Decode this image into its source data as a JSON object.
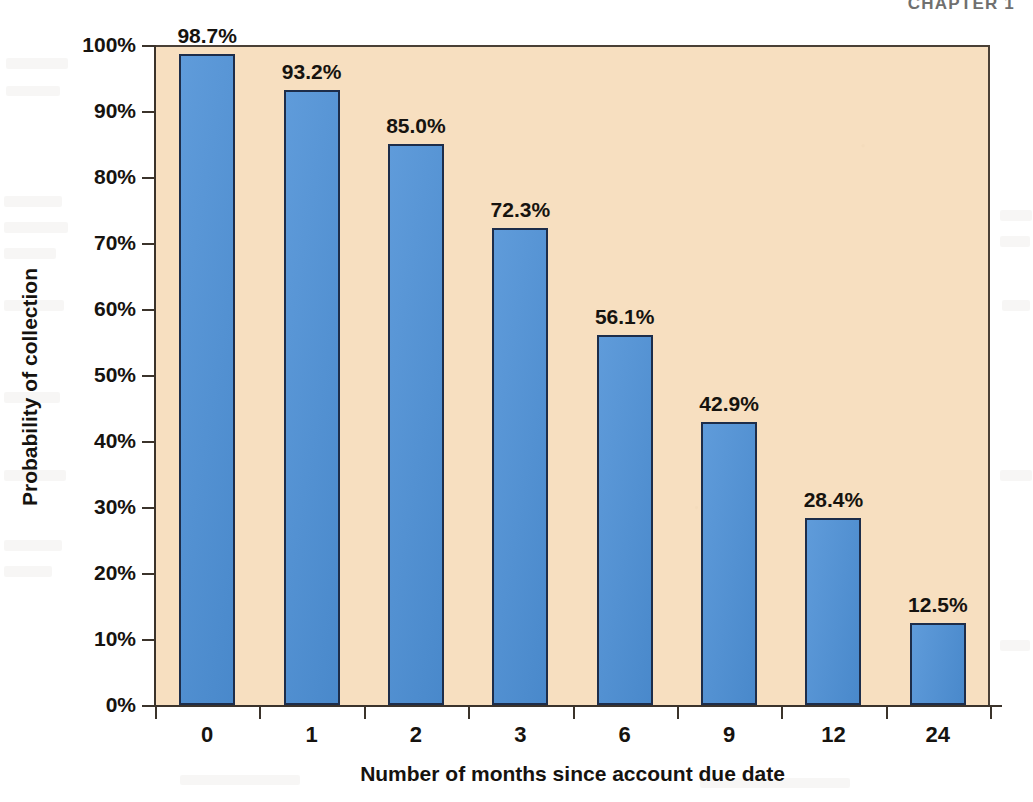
{
  "page": {
    "running_head": "CHAPTER 1",
    "background_color": "#ffffff"
  },
  "chart_data": {
    "type": "bar",
    "title": "",
    "categories": [
      "0",
      "1",
      "2",
      "3",
      "6",
      "9",
      "12",
      "24"
    ],
    "values": [
      98.7,
      93.2,
      85.0,
      72.3,
      56.1,
      42.9,
      28.4,
      12.5
    ],
    "data_labels": [
      "98.7%",
      "93.2%",
      "85.0%",
      "72.3%",
      "56.1%",
      "42.9%",
      "28.4%",
      "12.5%"
    ],
    "xlabel": "Number of months since account due date",
    "ylabel": "Probability of collection",
    "ylim": [
      0,
      100
    ],
    "ytick_labels": [
      "0%",
      "10%",
      "20%",
      "30%",
      "40%",
      "50%",
      "60%",
      "70%",
      "80%",
      "90%",
      "100%"
    ],
    "ytick_values": [
      0,
      10,
      20,
      30,
      40,
      50,
      60,
      70,
      80,
      90,
      100
    ],
    "grid": false,
    "legend": false,
    "legend_position": "none",
    "bar_color": "#4d90d6",
    "bar_border_color": "#1d2d4a",
    "plot_background_color": "#f7dfc0",
    "axis_color": "#3b332b",
    "text_color": "#16130f"
  }
}
